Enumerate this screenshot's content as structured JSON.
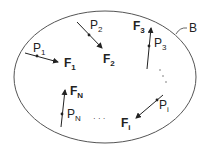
{
  "diagram": {
    "type": "free-body / system of forces on a rigid body",
    "body": {
      "label": "B",
      "shape": "ellipse",
      "stroke": "#555555"
    },
    "forces": [
      {
        "point": "P",
        "point_sub": "1",
        "force": "F",
        "force_sub": "1"
      },
      {
        "point": "P",
        "point_sub": "2",
        "force": "F",
        "force_sub": "2"
      },
      {
        "point": "P",
        "point_sub": "3",
        "force": "F",
        "force_sub": "3"
      },
      {
        "point": "P",
        "point_sub": "i",
        "force": "F",
        "force_sub": "i"
      },
      {
        "point": "P",
        "point_sub": "N",
        "force": "F",
        "force_sub": "N"
      }
    ],
    "ellipsis": "· · ·",
    "colors": {
      "line": "#333333",
      "text": "#222222",
      "background": "#ffffff"
    }
  }
}
